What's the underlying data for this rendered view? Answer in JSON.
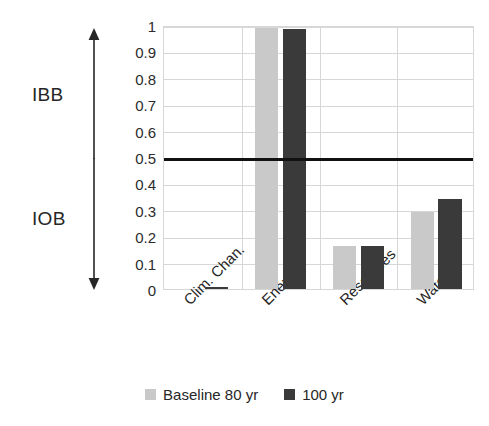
{
  "chart_data": {
    "type": "bar",
    "title": "",
    "subtitle": "",
    "xlabel": "",
    "ylabel": "",
    "categories": [
      "Clim. Chan.",
      "Energy",
      "Resources",
      "Water"
    ],
    "series": [
      {
        "name": "Baseline 80 yr",
        "color": "#c9c9c9",
        "values": [
          0.0,
          0.99,
          0.163,
          0.293
        ]
      },
      {
        "name": "100 yr",
        "color": "#3a3a3a",
        "values": [
          0.007,
          0.985,
          0.162,
          0.34
        ]
      }
    ],
    "ylim": [
      0,
      1
    ],
    "ytick_values": [
      0,
      0.1,
      0.2,
      0.3,
      0.4,
      0.5,
      0.6,
      0.7,
      0.8,
      0.9,
      1
    ],
    "ytick_labels": [
      "0",
      "0.1",
      "0.2",
      "0.3",
      "0.4",
      "0.5",
      "0.6",
      "0.7",
      "0.8",
      "0.9",
      "1"
    ],
    "grid": true,
    "grid_color": "#d7d7d7",
    "legend_position": "bottom",
    "annotations": {
      "threshold": {
        "value": 0.5,
        "color": "#111111",
        "width_px": 3
      },
      "regions": [
        {
          "label": "IBB",
          "direction": "up",
          "from": 0.5,
          "to": 1.0
        },
        {
          "label": "IOB",
          "direction": "down",
          "from": 0.5,
          "to": 0.0
        }
      ]
    },
    "xtick_rotation": -45
  },
  "axis": {
    "yticks": [
      {
        "label": "1",
        "value": 1
      },
      {
        "label": "0.9",
        "value": 0.9
      },
      {
        "label": "0.8",
        "value": 0.8
      },
      {
        "label": "0.7",
        "value": 0.7
      },
      {
        "label": "0.6",
        "value": 0.6
      },
      {
        "label": "0.5",
        "value": 0.5
      },
      {
        "label": "0.4",
        "value": 0.4
      },
      {
        "label": "0.3",
        "value": 0.3
      },
      {
        "label": "0.2",
        "value": 0.2
      },
      {
        "label": "0.1",
        "value": 0.1
      },
      {
        "label": "0",
        "value": 0
      }
    ]
  },
  "annotations": {
    "ibb": {
      "label": "IBB",
      "arrow_icon": "arrow-up-icon"
    },
    "iob": {
      "label": "IOB",
      "arrow_icon": "arrow-down-icon"
    }
  },
  "legend": {
    "items": [
      {
        "label": "Baseline 80 yr",
        "color": "#c9c9c9"
      },
      {
        "label": "100 yr",
        "color": "#3a3a3a"
      }
    ]
  }
}
